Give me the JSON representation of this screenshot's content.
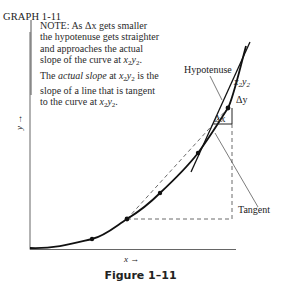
{
  "graph_label": "GRAPH 1-11",
  "note": {
    "line1": "NOTE: As Δx gets smaller",
    "line2": "the hypotenuse gets straighter",
    "line3": "and approaches the actual",
    "line4_pre": "slope of the curve at ",
    "line5_pre": "The ",
    "line5_italic": "actual slope",
    "line5_mid": " at ",
    "line5_post": " is the",
    "line6": "slope of a line that is tangent",
    "line7_pre": "to the curve at ",
    "point_x": "x",
    "point_y": "y",
    "point_sub": "2"
  },
  "labels": {
    "hypotenuse": "Hypotenuse",
    "point": "x₂y₂",
    "delta_y": "Δy",
    "delta_x": "Δx",
    "tangent": "Tangent",
    "x_axis": "x →",
    "y_axis": "y →"
  },
  "caption": "Figure 1–11",
  "colors": {
    "ink": "#222222",
    "background": "#ffffff"
  }
}
